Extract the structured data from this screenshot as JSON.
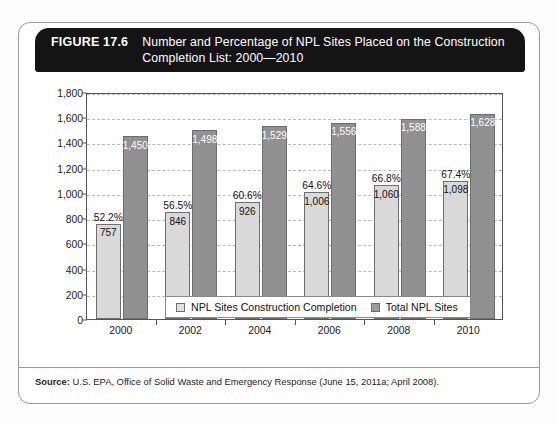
{
  "figure": {
    "number": "FIGURE 17.6",
    "title_line1": "Number and Percentage of NPL Sites Placed on the Construction",
    "title_line2": "Completion List: 2000—2010",
    "source_prefix": "Source:",
    "source_text": " U.S. EPA, Office of Solid Waste and Emergency Response (June 15, 2011a; April 2008)."
  },
  "chart_data": {
    "type": "bar",
    "title": "Number and Percentage of NPL Sites Placed on the Construction Completion List: 2000—2010",
    "xlabel": "",
    "ylabel": "",
    "ylim": [
      0,
      1800
    ],
    "ytick_values": [
      0,
      200,
      400,
      600,
      800,
      1000,
      1200,
      1400,
      1600,
      1800
    ],
    "ytick_labels": [
      "0",
      "200",
      "400",
      "600",
      "800",
      "1,000",
      "1,200",
      "1,400",
      "1,600",
      "1,800"
    ],
    "grid": true,
    "grid_style": "dashed-horizontal",
    "legend_position": "bottom",
    "categories": [
      "2000",
      "2002",
      "2004",
      "2006",
      "2008",
      "2010"
    ],
    "series": [
      {
        "name": "NPL Sites Construction Completion",
        "color": "#d9d9d9",
        "values": [
          757,
          846,
          926,
          1006,
          1060,
          1098
        ],
        "value_labels": [
          "757",
          "846",
          "926",
          "1,006",
          "1,060",
          "1,098"
        ],
        "percent_labels": [
          "52.2%",
          "56.5%",
          "60.6%",
          "64.6%",
          "66.8%",
          "67.4%"
        ],
        "percent_values": [
          52.2,
          56.5,
          60.6,
          64.6,
          66.8,
          67.4
        ]
      },
      {
        "name": "Total NPL Sites",
        "color": "#919191",
        "values": [
          1450,
          1498,
          1529,
          1556,
          1588,
          1628
        ],
        "value_labels": [
          "1,450",
          "1,498",
          "1,529",
          "1,556",
          "1,588",
          "1,628"
        ],
        "percent_labels": [
          "",
          "",
          "",
          "",
          "",
          ""
        ],
        "percent_values": []
      }
    ]
  },
  "legend": {
    "entries": [
      {
        "label": "NPL Sites Construction Completion",
        "swatch": "light"
      },
      {
        "label": "Total NPL Sites",
        "swatch": "dark"
      }
    ]
  }
}
